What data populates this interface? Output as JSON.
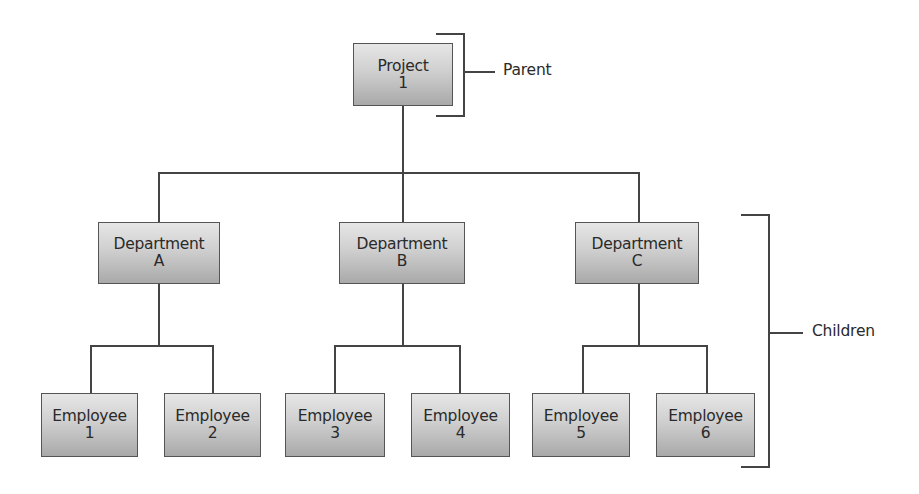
{
  "diagram": {
    "type": "hierarchy",
    "root": {
      "title": "Project",
      "sub": "1"
    },
    "departments": [
      {
        "title": "Department",
        "sub": "A"
      },
      {
        "title": "Department",
        "sub": "B"
      },
      {
        "title": "Department",
        "sub": "C"
      }
    ],
    "employees": [
      {
        "title": "Employee",
        "sub": "1"
      },
      {
        "title": "Employee",
        "sub": "2"
      },
      {
        "title": "Employee",
        "sub": "3"
      },
      {
        "title": "Employee",
        "sub": "4"
      },
      {
        "title": "Employee",
        "sub": "5"
      },
      {
        "title": "Employee",
        "sub": "6"
      }
    ],
    "annotations": {
      "parent": "Parent",
      "children": "Children"
    },
    "colors": {
      "line": "#444444",
      "box_top": "#e6e6e6",
      "box_bottom": "#a9a9a9",
      "text": "#2a2a2a"
    }
  }
}
